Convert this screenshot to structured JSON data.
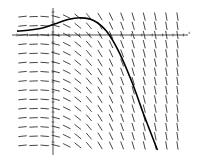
{
  "chart_data": {
    "type": "direction_field",
    "title": "",
    "xlabel": "x",
    "ylabel": "",
    "grid": false,
    "legend": null,
    "field": {
      "x_range": [
        -3,
        10
      ],
      "y_range": [
        -10,
        3
      ],
      "columns": 15,
      "rows": 15
    },
    "solution_curve": {
      "x": [
        -3,
        -2,
        -1,
        0,
        1,
        2,
        3,
        4,
        5,
        6,
        7,
        8
      ],
      "y": [
        1.2,
        1.3,
        1.5,
        1.9,
        2.3,
        2.45,
        2.2,
        1.2,
        -0.8,
        -3.6,
        -6.9,
        -10
      ]
    },
    "axes": {
      "x_axis_label": "x",
      "origin_px": [
        53,
        35
      ]
    },
    "colors": {
      "field_segments": "#333333",
      "solution_curve": "#000000",
      "axes": "#222222",
      "background": "#ffffff"
    }
  }
}
